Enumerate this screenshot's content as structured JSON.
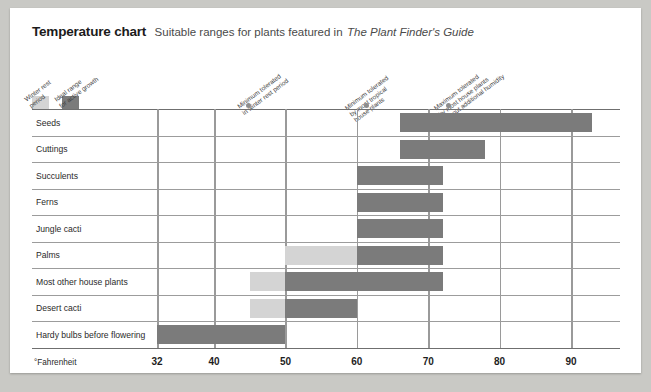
{
  "header": {
    "title": "Temperature chart",
    "subtitle": "Suitable ranges for plants featured in",
    "subtitle_italic": "The Plant Finder's Guide"
  },
  "legend": {
    "items": [
      {
        "label_line1": "Winter rest",
        "label_line2": "period",
        "color": "#d4d4d4",
        "icon": "legend-swatch-winter-rest"
      },
      {
        "label_line1": "Ideal range",
        "label_line2": "for active growth",
        "color": "#7b7b7b",
        "icon": "legend-swatch-ideal-range"
      }
    ]
  },
  "annotations": [
    {
      "line1": "Minimum tolerated",
      "line2": "in winter rest period",
      "line3": "",
      "value": 44
    },
    {
      "line1": "Minimum tolerated",
      "line2": "by most tropical",
      "line3": "house plants",
      "value": 60
    },
    {
      "line1": "Maximum tolerated",
      "line2": "by most house plants",
      "line3": "without additional humidity",
      "value": 72
    }
  ],
  "chart_data": {
    "type": "bar",
    "title": "Temperature chart",
    "subtitle": "Suitable ranges for plants featured in The Plant Finder's Guide",
    "orientation": "horizontal",
    "xlabel": "°Fahrenheit",
    "ylabel": "",
    "xlim": [
      27,
      97
    ],
    "ticks": [
      32,
      40,
      50,
      60,
      70,
      80,
      90
    ],
    "tick_labels": [
      "32",
      "40",
      "50",
      "60",
      "70",
      "80",
      "90"
    ],
    "grid": true,
    "legend_position": "top-left",
    "series": [
      {
        "name": "Winter rest period",
        "color": "#d4d4d4"
      },
      {
        "name": "Ideal range for active growth",
        "color": "#7b7b7b"
      }
    ],
    "categories": [
      "Seeds",
      "Cuttings",
      "Succulents",
      "Ferns",
      "Jungle cacti",
      "Palms",
      "Most other house plants",
      "Desert cacti",
      "Hardy bulbs before flowering"
    ],
    "rows": [
      {
        "category": "Seeds",
        "rest": null,
        "ideal": [
          66,
          93
        ]
      },
      {
        "category": "Cuttings",
        "rest": null,
        "ideal": [
          66,
          78
        ]
      },
      {
        "category": "Succulents",
        "rest": null,
        "ideal": [
          60,
          72
        ]
      },
      {
        "category": "Ferns",
        "rest": null,
        "ideal": [
          60,
          72
        ]
      },
      {
        "category": "Jungle cacti",
        "rest": null,
        "ideal": [
          60,
          72
        ]
      },
      {
        "category": "Palms",
        "rest": [
          50,
          60
        ],
        "ideal": [
          60,
          72
        ]
      },
      {
        "category": "Most other house plants",
        "rest": [
          45,
          50
        ],
        "ideal": [
          50,
          72
        ]
      },
      {
        "category": "Desert cacti",
        "rest": [
          45,
          50
        ],
        "ideal": [
          50,
          60
        ]
      },
      {
        "category": "Hardy bulbs before flowering",
        "rest": null,
        "ideal": [
          32,
          50
        ]
      }
    ]
  },
  "axis": {
    "unit_label": "°Fahrenheit"
  }
}
